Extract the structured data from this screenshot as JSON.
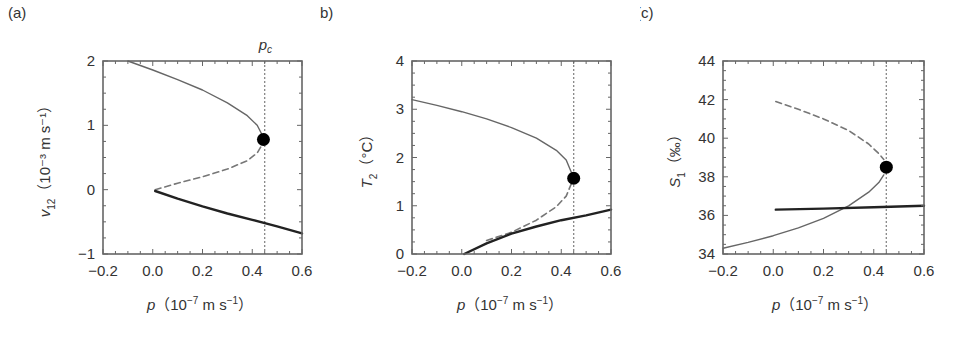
{
  "figure": {
    "critical_label": "p",
    "critical_sub": "c"
  },
  "chart_data": [
    {
      "type": "line",
      "panel_label": "(a)",
      "title": "",
      "xlabel": "p（10⁻⁷ m s⁻¹）",
      "ylabel": "v12（10⁻³ m s⁻¹）",
      "ylabel_main": "v",
      "ylabel_sub": "12",
      "ylabel_unit": "（10⁻³ m s⁻¹）",
      "xlim": [
        -0.2,
        0.6
      ],
      "ylim": [
        -1,
        2
      ],
      "xticks": [
        "−0.2",
        "0.0",
        "0.2",
        "0.4",
        "0.6"
      ],
      "xtick_values": [
        -0.2,
        0.0,
        0.2,
        0.4,
        0.6
      ],
      "yticks": [
        "−1",
        "0",
        "1",
        "2"
      ],
      "ytick_values": [
        -1,
        0,
        1,
        2
      ],
      "critical_x": 0.45,
      "bifurcation_point": {
        "x": 0.445,
        "y": 0.78
      },
      "series": [
        {
          "name": "upper stable branch",
          "style": "solid-thin",
          "x": [
            -0.1,
            0.0,
            0.1,
            0.2,
            0.3,
            0.38,
            0.42,
            0.44
          ],
          "y": [
            2.0,
            1.86,
            1.71,
            1.55,
            1.35,
            1.15,
            1.0,
            0.85
          ]
        },
        {
          "name": "unstable branch",
          "style": "dashed",
          "x": [
            0.01,
            0.1,
            0.2,
            0.3,
            0.38,
            0.42,
            0.44
          ],
          "y": [
            0.0,
            0.1,
            0.2,
            0.32,
            0.45,
            0.57,
            0.7
          ]
        },
        {
          "name": "lower stable branch",
          "style": "solid-thick",
          "x": [
            0.01,
            0.1,
            0.2,
            0.3,
            0.4,
            0.5,
            0.6
          ],
          "y": [
            -0.02,
            -0.14,
            -0.26,
            -0.37,
            -0.47,
            -0.57,
            -0.68
          ]
        }
      ]
    },
    {
      "type": "line",
      "panel_label": "(b)",
      "title": "",
      "xlabel": "p（10⁻⁷ m s⁻¹）",
      "ylabel": "T2（°C）",
      "ylabel_main": "T",
      "ylabel_sub": "2",
      "ylabel_unit": "（°C）",
      "xlim": [
        -0.2,
        0.6
      ],
      "ylim": [
        0,
        4
      ],
      "xticks": [
        "−0.2",
        "0.0",
        "0.2",
        "0.4",
        "0.6"
      ],
      "xtick_values": [
        -0.2,
        0.0,
        0.2,
        0.4,
        0.6
      ],
      "yticks": [
        "0",
        "1",
        "2",
        "3",
        "4"
      ],
      "ytick_values": [
        0,
        1,
        2,
        3,
        4
      ],
      "critical_x": 0.45,
      "bifurcation_point": {
        "x": 0.45,
        "y": 1.57
      },
      "series": [
        {
          "name": "upper stable branch",
          "style": "solid-thin",
          "x": [
            -0.2,
            -0.1,
            0.0,
            0.1,
            0.2,
            0.3,
            0.38,
            0.42,
            0.44
          ],
          "y": [
            3.2,
            3.08,
            2.95,
            2.8,
            2.62,
            2.4,
            2.15,
            1.95,
            1.7
          ]
        },
        {
          "name": "unstable branch",
          "style": "dashed",
          "x": [
            0.1,
            0.2,
            0.3,
            0.38,
            0.42,
            0.44
          ],
          "y": [
            0.28,
            0.45,
            0.7,
            0.98,
            1.2,
            1.45
          ]
        },
        {
          "name": "lower stable branch",
          "style": "solid-thick",
          "x": [
            0.01,
            0.1,
            0.2,
            0.3,
            0.4,
            0.5,
            0.6
          ],
          "y": [
            0.0,
            0.22,
            0.42,
            0.57,
            0.7,
            0.8,
            0.92
          ]
        }
      ]
    },
    {
      "type": "line",
      "panel_label": "(c)",
      "title": "",
      "xlabel": "p（10⁻⁷ m s⁻¹）",
      "ylabel": "S1（‰）",
      "ylabel_main": "S",
      "ylabel_sub": "1",
      "ylabel_unit": "（‰）",
      "xlim": [
        -0.2,
        0.6
      ],
      "ylim": [
        34,
        44
      ],
      "xticks": [
        "−0.2",
        "0.0",
        "0.2",
        "0.4",
        "0.6"
      ],
      "xtick_values": [
        -0.2,
        0.0,
        0.2,
        0.4,
        0.6
      ],
      "yticks": [
        "34",
        "36",
        "38",
        "40",
        "42",
        "44"
      ],
      "ytick_values": [
        34,
        36,
        38,
        40,
        42,
        44
      ],
      "critical_x": 0.45,
      "bifurcation_point": {
        "x": 0.45,
        "y": 38.5
      },
      "series": [
        {
          "name": "unstable branch",
          "style": "dashed",
          "x": [
            0.01,
            0.1,
            0.2,
            0.3,
            0.38,
            0.42,
            0.44
          ],
          "y": [
            41.9,
            41.5,
            41.0,
            40.4,
            39.7,
            39.2,
            38.9
          ]
        },
        {
          "name": "stable branch",
          "style": "solid-thin",
          "x": [
            -0.2,
            -0.1,
            0.0,
            0.1,
            0.2,
            0.3,
            0.38,
            0.42,
            0.44
          ],
          "y": [
            34.3,
            34.6,
            34.95,
            35.35,
            35.85,
            36.5,
            37.2,
            37.7,
            38.1
          ]
        },
        {
          "name": "lower stable branch",
          "style": "solid-thick",
          "x": [
            0.01,
            0.2,
            0.4,
            0.6
          ],
          "y": [
            36.3,
            36.35,
            36.42,
            36.5
          ]
        }
      ]
    }
  ]
}
